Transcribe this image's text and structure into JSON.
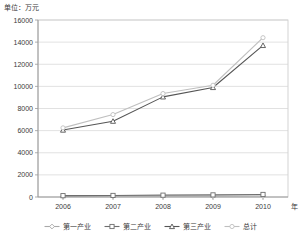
{
  "chart_data": {
    "type": "line",
    "title": "",
    "unit_label": "单位：万元",
    "xlabel": "年",
    "ylabel": "",
    "categories": [
      "2006",
      "2007",
      "2008",
      "2009",
      "2010"
    ],
    "x": [
      2006,
      2007,
      2008,
      2009,
      2010
    ],
    "ylim": [
      0,
      16000
    ],
    "ytick_step": 2000,
    "yticks": [
      "0",
      "2000",
      "4000",
      "6000",
      "8000",
      "10000",
      "12000",
      "14000",
      "16000"
    ],
    "grid": "horizontal",
    "legend_position": "bottom",
    "series": [
      {
        "name": "第一产业",
        "marker": "diamond",
        "color": "#a9a9a9",
        "values": [
          60,
          65,
          70,
          80,
          95
        ]
      },
      {
        "name": "第二产业",
        "marker": "square",
        "color": "#6e6e6e",
        "values": [
          120,
          140,
          165,
          190,
          230
        ]
      },
      {
        "name": "第三产业",
        "marker": "triangle",
        "color": "#555555",
        "values": [
          6050,
          6850,
          9050,
          9900,
          13700
        ]
      },
      {
        "name": "总计",
        "marker": "circle",
        "color": "#bfbfbf",
        "values": [
          6250,
          7450,
          9350,
          10100,
          14400
        ]
      }
    ]
  },
  "axes": {
    "plot_left": 38,
    "plot_right": 288,
    "plot_top": 20,
    "plot_bottom": 197
  }
}
